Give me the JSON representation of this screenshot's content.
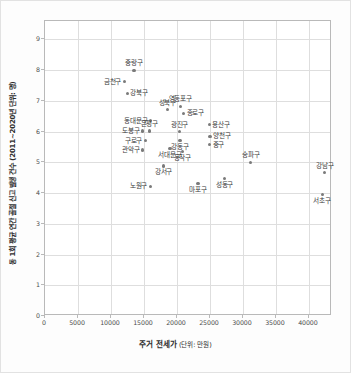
{
  "chart_data": {
    "type": "scatter",
    "title": "",
    "xlabel": "주거 전세가",
    "xlabel_unit": "(단위: 만원)",
    "ylabel": "동 1회 평균 연간 골절 신고 발생 건수 (2011~2020년 단위: 명)",
    "xlim": [
      0,
      43500
    ],
    "ylim": [
      0,
      9.6
    ],
    "xticks": [
      "0",
      "5000",
      "10000",
      "15000",
      "20000",
      "25000",
      "30000",
      "35000",
      "40000"
    ],
    "xtick_values": [
      0,
      5000,
      10000,
      15000,
      20000,
      25000,
      30000,
      35000,
      40000
    ],
    "yticks": [
      "0",
      "1",
      "2",
      "3",
      "4",
      "5",
      "6",
      "7",
      "8",
      "9"
    ],
    "ytick_values": [
      0,
      1,
      2,
      3,
      4,
      5,
      6,
      7,
      8,
      9
    ],
    "grid": true,
    "legend": "none",
    "marker_color": "#7a7a7a",
    "grid_color": "#dedede",
    "axis_color": "#b9b9b9",
    "points": [
      {
        "label": "중랑구",
        "x": 13500,
        "y": 8.0,
        "pos": "above"
      },
      {
        "label": "금천구",
        "x": 12000,
        "y": 7.63,
        "pos": "left"
      },
      {
        "label": "강북구",
        "x": 12450,
        "y": 7.25,
        "pos": "right"
      },
      {
        "label": "영등포구",
        "x": 20500,
        "y": 6.82,
        "pos": "above"
      },
      {
        "label": "성북구",
        "x": 18550,
        "y": 6.72,
        "pos": "above"
      },
      {
        "label": "종로구",
        "x": 21000,
        "y": 6.6,
        "pos": "right"
      },
      {
        "label": "동대문구",
        "x": 16000,
        "y": 6.35,
        "pos": "left"
      },
      {
        "label": "용산구",
        "x": 24900,
        "y": 6.22,
        "pos": "right"
      },
      {
        "label": "도봉구",
        "x": 14800,
        "y": 6.02,
        "pos": "left"
      },
      {
        "label": "은평구",
        "x": 15800,
        "y": 6.02,
        "pos": "above"
      },
      {
        "label": "광진구",
        "x": 20400,
        "y": 6.0,
        "pos": "above"
      },
      {
        "label": "양천구",
        "x": 25000,
        "y": 5.85,
        "pos": "right"
      },
      {
        "label": "구로구",
        "x": 15200,
        "y": 5.7,
        "pos": "left"
      },
      {
        "label": "강동구",
        "x": 20450,
        "y": 5.7,
        "pos": "below"
      },
      {
        "label": "중구",
        "x": 24950,
        "y": 5.58,
        "pos": "right"
      },
      {
        "label": "서대문구",
        "x": 18950,
        "y": 5.45,
        "pos": "below"
      },
      {
        "label": "관악구",
        "x": 14750,
        "y": 5.4,
        "pos": "left"
      },
      {
        "label": "동작구",
        "x": 20800,
        "y": 5.35,
        "pos": "below"
      },
      {
        "label": "송파구",
        "x": 31200,
        "y": 5.0,
        "pos": "above"
      },
      {
        "label": "강남구",
        "x": 42400,
        "y": 4.66,
        "pos": "above"
      },
      {
        "label": "강서구",
        "x": 17950,
        "y": 4.88,
        "pos": "below"
      },
      {
        "label": "성동구",
        "x": 27200,
        "y": 4.47,
        "pos": "below"
      },
      {
        "label": "마포구",
        "x": 23200,
        "y": 4.3,
        "pos": "below"
      },
      {
        "label": "노원구",
        "x": 15950,
        "y": 4.22,
        "pos": "left"
      },
      {
        "label": "서초구",
        "x": 42000,
        "y": 3.96,
        "pos": "below"
      }
    ]
  }
}
